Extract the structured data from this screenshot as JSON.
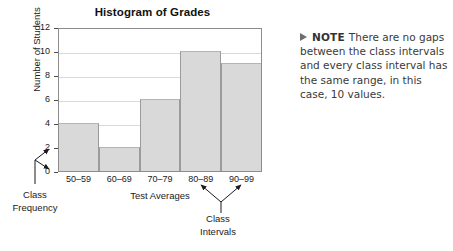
{
  "chart_data": {
    "type": "bar",
    "title": "Histogram of Grades",
    "xlabel": "Test Averages",
    "ylabel": "Number of Students",
    "categories": [
      "50–59",
      "60–69",
      "70–79",
      "80–89",
      "90–99"
    ],
    "values": [
      4,
      2,
      6,
      10,
      9
    ],
    "ylim": [
      0,
      12
    ],
    "yticks": [
      0,
      2,
      4,
      6,
      8,
      10,
      12
    ],
    "ytick_labels": [
      "0",
      "2",
      "4",
      "6",
      "8",
      "10",
      "12"
    ],
    "grid": true,
    "legend": null,
    "bar_color": "#d9d9d9",
    "bar_edge_color": "#9b9b9b",
    "annotations": [
      {
        "name": "class-frequency",
        "text": "Class\nFrequency",
        "points_to": [
          "y-axis tick 2",
          "y-axis tick 0"
        ]
      },
      {
        "name": "class-intervals",
        "text": "Class\nIntervals",
        "points_to": [
          "80–89",
          "90–99"
        ]
      }
    ]
  },
  "chart": {
    "title": "Histogram of Grades",
    "ylabel": "Number of Students",
    "xlabel": "Test Averages"
  },
  "annotations": {
    "class_frequency_line1": "Class",
    "class_frequency_line2": "Frequency",
    "class_intervals_line1": "Class",
    "class_intervals_line2": "Intervals"
  },
  "note": {
    "marker": "triangle-right-icon",
    "label": "NOTE",
    "text": "There are no gaps between the class intervals and every class interval has the same range, in this case, 10 values."
  }
}
